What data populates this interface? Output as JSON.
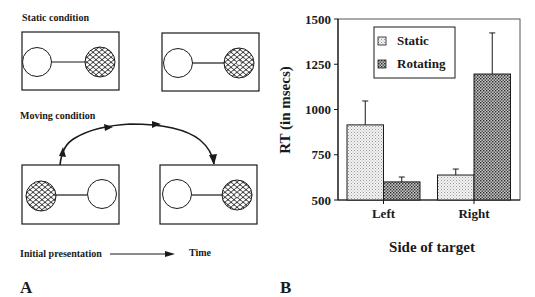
{
  "panel_a": {
    "label": "A",
    "static_condition_title": "Static condition",
    "moving_condition_title": "Moving condition",
    "timeline_start_label": "Initial presentation",
    "timeline_end_label": "Time"
  },
  "panel_b": {
    "label": "B"
  },
  "colors": {
    "ink": "#1a1a1a",
    "static_fill": "#e4e4e4",
    "rotating_fill": "#8a8a8a",
    "background": "#ffffff"
  },
  "chart_data": {
    "type": "bar",
    "title": "",
    "xlabel": "Side of target",
    "ylabel": "RT (in msecs)",
    "categories": [
      "Left",
      "Right"
    ],
    "series": [
      {
        "name": "Static",
        "values": [
          915,
          638
        ],
        "error_upper": [
          1047,
          671
        ]
      },
      {
        "name": "Rotating",
        "values": [
          600,
          1196
        ],
        "error_upper": [
          627,
          1423
        ]
      }
    ],
    "ylim": [
      500,
      1500
    ],
    "yticks": [
      500,
      750,
      1000,
      1250,
      1500
    ],
    "grid": false,
    "legend_position": "upper-left-inside"
  }
}
